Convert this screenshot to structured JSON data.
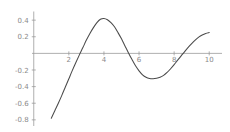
{
  "chart_data": {
    "type": "line",
    "title": "",
    "subtitle": "",
    "xlabel": "",
    "ylabel": "",
    "xlim": [
      -0.1,
      10.5
    ],
    "ylim": [
      -0.85,
      0.48
    ],
    "grid": false,
    "legend": null,
    "background_color": "#ffffff",
    "axis_color": "#9a9a9a",
    "tick_label_color": "#8a8a8a",
    "series": [
      {
        "name": "curve",
        "color": "#4a4a4a",
        "linewidth": 1.05,
        "x": [
          1.0,
          1.2,
          1.4,
          1.6,
          1.8,
          2.0,
          2.2,
          2.4,
          2.6,
          2.8,
          3.0,
          3.2,
          3.4,
          3.6,
          3.8,
          4.0,
          4.2,
          4.4,
          4.6,
          4.8,
          5.0,
          5.2,
          5.4,
          5.6,
          5.8,
          6.0,
          6.2,
          6.4,
          6.6,
          6.8,
          7.0,
          7.2,
          7.4,
          7.6,
          7.8,
          8.0,
          8.2,
          8.4,
          8.6,
          8.8,
          9.0,
          9.2,
          9.4,
          9.6,
          9.8,
          10.0
        ],
        "y": [
          -0.78,
          -0.69,
          -0.6,
          -0.505,
          -0.405,
          -0.305,
          -0.205,
          -0.11,
          -0.018,
          0.07,
          0.16,
          0.24,
          0.31,
          0.37,
          0.41,
          0.42,
          0.405,
          0.37,
          0.32,
          0.25,
          0.175,
          0.09,
          0.005,
          -0.075,
          -0.15,
          -0.21,
          -0.258,
          -0.288,
          -0.302,
          -0.305,
          -0.3,
          -0.288,
          -0.265,
          -0.23,
          -0.185,
          -0.135,
          -0.082,
          -0.03,
          0.022,
          0.072,
          0.118,
          0.16,
          0.196,
          0.222,
          0.24,
          0.25
        ]
      }
    ],
    "x_ticks": [
      {
        "value": 2,
        "label": "2"
      },
      {
        "value": 4,
        "label": "4"
      },
      {
        "value": 6,
        "label": "6"
      },
      {
        "value": 8,
        "label": "8"
      },
      {
        "value": 10,
        "label": "10"
      }
    ],
    "y_ticks": [
      {
        "value": 0.4,
        "label": "0.4"
      },
      {
        "value": 0.2,
        "label": "0.2"
      },
      {
        "value": -0.2,
        "label": "-0.2"
      },
      {
        "value": -0.4,
        "label": "-0.4"
      },
      {
        "value": -0.6,
        "label": "-0.6"
      },
      {
        "value": -0.8,
        "label": "-0.8"
      }
    ],
    "annotations": {
      "peak": {
        "x": 3.9,
        "y": 0.42
      },
      "trough": {
        "x": 6.85,
        "y": -0.305
      },
      "zero_crossings": [
        2.62,
        5.41,
        8.48
      ]
    }
  }
}
